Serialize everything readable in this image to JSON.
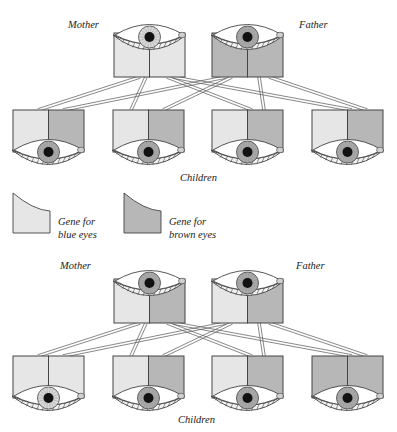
{
  "colors": {
    "blue_gene": "#e6e6e6",
    "brown_gene": "#b7b7b7",
    "outline": "#444444",
    "iris_brown": "#a9a9a9",
    "iris_blue": "#d9d9d9",
    "pupil": "#111111",
    "background": "#ffffff"
  },
  "legend": {
    "blue": {
      "line1": "Gene for",
      "line2": "blue eyes"
    },
    "brown": {
      "line1": "Gene for",
      "line2": "brown eyes"
    }
  },
  "panels": [
    {
      "id": "top",
      "mother_label": "Mother",
      "father_label": "Father",
      "children_label": "Children",
      "mother": {
        "genes": [
          "blue",
          "blue"
        ],
        "eye": "blue"
      },
      "father": {
        "genes": [
          "brown",
          "brown"
        ],
        "eye": "brown"
      },
      "children": [
        {
          "genes": [
            "blue",
            "brown"
          ],
          "eye": "brown"
        },
        {
          "genes": [
            "blue",
            "brown"
          ],
          "eye": "brown"
        },
        {
          "genes": [
            "blue",
            "brown"
          ],
          "eye": "brown"
        },
        {
          "genes": [
            "blue",
            "brown"
          ],
          "eye": "brown"
        }
      ]
    },
    {
      "id": "bottom",
      "mother_label": "Mother",
      "father_label": "Father",
      "children_label": "Children",
      "mother": {
        "genes": [
          "blue",
          "brown"
        ],
        "eye": "brown"
      },
      "father": {
        "genes": [
          "blue",
          "brown"
        ],
        "eye": "brown"
      },
      "children": [
        {
          "genes": [
            "blue",
            "blue"
          ],
          "eye": "blue"
        },
        {
          "genes": [
            "blue",
            "brown"
          ],
          "eye": "brown"
        },
        {
          "genes": [
            "blue",
            "brown"
          ],
          "eye": "brown"
        },
        {
          "genes": [
            "brown",
            "brown"
          ],
          "eye": "brown"
        }
      ]
    }
  ]
}
